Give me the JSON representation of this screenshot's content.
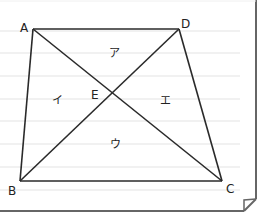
{
  "diagram": {
    "type": "geometry-quadrilateral-with-diagonals",
    "vertices": {
      "A": {
        "label": "A",
        "x": 33,
        "y": 29
      },
      "D": {
        "label": "D",
        "x": 179,
        "y": 29
      },
      "B": {
        "label": "B",
        "x": 20,
        "y": 181
      },
      "C": {
        "label": "C",
        "x": 222,
        "y": 181
      }
    },
    "intersection": {
      "label": "E",
      "x": 113,
      "y": 92
    },
    "regions": [
      {
        "id": "top",
        "label": "ア"
      },
      {
        "id": "left",
        "label": "イ"
      },
      {
        "id": "bottom",
        "label": "ウ"
      },
      {
        "id": "right",
        "label": "エ"
      }
    ],
    "colors": {
      "line": "#2a2a2a",
      "ruled_line": "#e3e3e3",
      "border": "#666666",
      "background": "#ffffff"
    }
  }
}
